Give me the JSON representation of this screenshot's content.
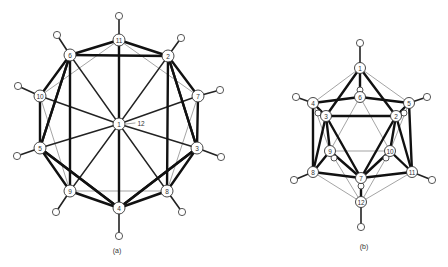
{
  "figure": {
    "panels": [
      {
        "id": "a",
        "caption": "(a)",
        "view": "viewed down the 1-12 axis",
        "center_label": "1",
        "center_hidden_label": "12",
        "atoms": [
          {
            "label": "11"
          },
          {
            "label": "6"
          },
          {
            "label": "2"
          },
          {
            "label": "10"
          },
          {
            "label": "7"
          },
          {
            "label": "1"
          },
          {
            "label": "5"
          },
          {
            "label": "3"
          },
          {
            "label": "9"
          },
          {
            "label": "8"
          },
          {
            "label": "4"
          }
        ]
      },
      {
        "id": "b",
        "caption": "(b)",
        "view": "side view",
        "atoms": [
          {
            "label": "1"
          },
          {
            "label": "6"
          },
          {
            "label": "4"
          },
          {
            "label": "5"
          },
          {
            "label": "3"
          },
          {
            "label": "2"
          },
          {
            "label": "9"
          },
          {
            "label": "10"
          },
          {
            "label": "8"
          },
          {
            "label": "11"
          },
          {
            "label": "7"
          },
          {
            "label": "12"
          }
        ]
      }
    ]
  }
}
